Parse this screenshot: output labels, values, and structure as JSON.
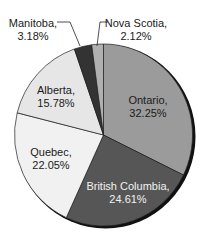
{
  "chart_data": {
    "type": "pie",
    "title": "",
    "start_angle": "12 o'clock",
    "direction": "clockwise",
    "slices": [
      {
        "label": "Ontario",
        "value": 32.25,
        "display": "32.25%",
        "color": "#9b9b9b",
        "text_color": "#1a1a1a"
      },
      {
        "label": "British Columbia",
        "value": 24.61,
        "display": "24.61%",
        "color": "#565656",
        "text_color": "#f2f2f2"
      },
      {
        "label": "Quebec",
        "value": 22.05,
        "display": "22.05%",
        "color": "#f1f1f1",
        "text_color": "#1a1a1a"
      },
      {
        "label": "Alberta",
        "value": 15.78,
        "display": "15.78%",
        "color": "#e6e6e6",
        "text_color": "#1a1a1a"
      },
      {
        "label": "Manitoba",
        "value": 3.18,
        "display": "3.18%",
        "color": "#333333",
        "text_color": "#1a1a1a"
      },
      {
        "label": "Nova Scotia",
        "value": 2.12,
        "display": "2.12%",
        "color": "#b0b0b0",
        "text_color": "#1a1a1a"
      }
    ],
    "legend": "none (labels on/near slices)"
  },
  "labels": {
    "ontario_name": "Ontario,",
    "ontario_pct": "32.25%",
    "bc_name": "British Columbia,",
    "bc_pct": "24.61%",
    "quebec_name": "Quebec,",
    "quebec_pct": "22.05%",
    "alberta_name": "Alberta,",
    "alberta_pct": "15.78%",
    "manitoba_name": "Manitoba,",
    "manitoba_pct": "3.18%",
    "novascotia_name": "Nova Scotia,",
    "novascotia_pct": "2.12%"
  }
}
